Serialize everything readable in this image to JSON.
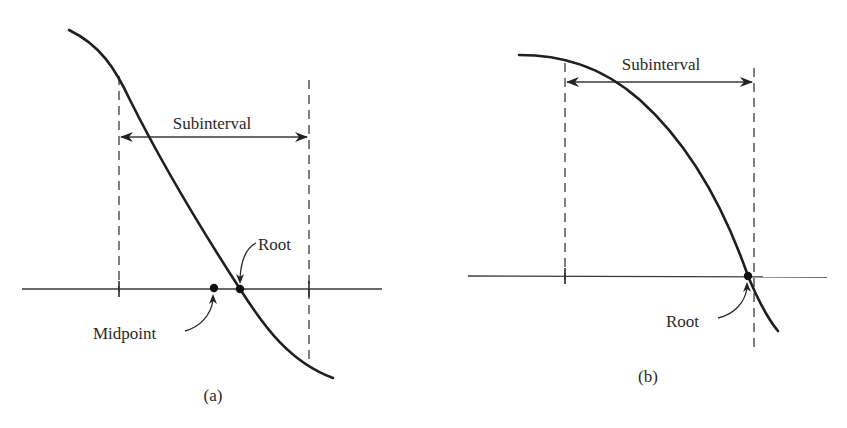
{
  "figure": {
    "panels": [
      {
        "id": "a",
        "caption": "(a)",
        "interval_label": "Subinterval",
        "root_label": "Root",
        "midpoint_label": "Midpoint",
        "description": "Decreasing curve crossing the x-axis inside a subinterval; midpoint lies left of the root"
      },
      {
        "id": "b",
        "caption": "(b)",
        "interval_label": "Subinterval",
        "root_label": "Root",
        "description": "Concave-down decreasing curve crossing the x-axis just left of the subinterval's right endpoint"
      }
    ],
    "colors": {
      "ink": "#1f1f1f",
      "background": "#ffffff"
    }
  }
}
